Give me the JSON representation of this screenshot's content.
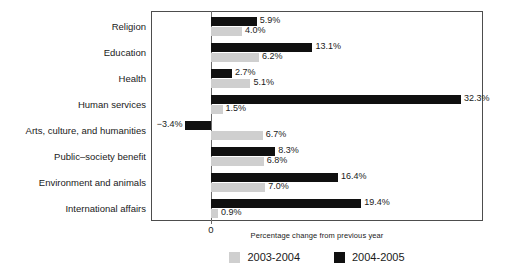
{
  "chart_data": {
    "type": "bar",
    "orientation": "horizontal",
    "title": "",
    "xlabel": "Percentage change from previous year",
    "ylabel": "",
    "grid": false,
    "legend_position": "bottom",
    "xlim": [
      -4.5,
      38.0
    ],
    "x_ticks": [
      "0"
    ],
    "categories": [
      "Religion",
      "Education",
      "Health",
      "Human services",
      "Arts, culture, and humanities",
      "Public–society benefit",
      "Environment and animals",
      "International affairs"
    ],
    "series": [
      {
        "name": "2003-2004",
        "color": "#cfcfcf",
        "values": [
          4.0,
          6.2,
          5.1,
          1.5,
          6.7,
          6.8,
          7.0,
          0.9
        ],
        "labels": [
          "4.0%",
          "6.2%",
          "5.1%",
          "1.5%",
          "6.7%",
          "6.8%",
          "7.0%",
          "0.9%"
        ]
      },
      {
        "name": "2004-2005",
        "color": "#101010",
        "values": [
          5.9,
          13.1,
          2.7,
          32.3,
          -3.4,
          8.3,
          16.4,
          19.4
        ],
        "labels": [
          "5.9%",
          "13.1%",
          "2.7%",
          "32.3%",
          "−3.4%",
          "8.3%",
          "16.4%",
          "19.4%"
        ]
      }
    ]
  },
  "axis": {
    "zero_tick_label": "0",
    "x_title": "Percentage change from previous year"
  },
  "legend": {
    "items": [
      {
        "label": "2003-2004",
        "color": "#cfcfcf"
      },
      {
        "label": "2004-2005",
        "color": "#101010"
      }
    ]
  }
}
